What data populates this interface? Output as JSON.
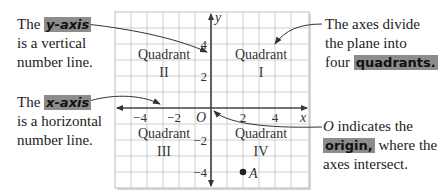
{
  "callouts": {
    "y_axis": {
      "prefix": "The ",
      "term": "y-axis",
      "line2": "is a vertical",
      "line3": "number line."
    },
    "x_axis": {
      "prefix": "The ",
      "term": "x-axis",
      "line2": "is a horizontal",
      "line3": "number line."
    },
    "quadrants": {
      "line1": "The axes divide",
      "line2": "the plane into",
      "prefix3": "four ",
      "term": "quadrants."
    },
    "origin": {
      "symbol": "O",
      "line1_rest": " indicates the",
      "term": "origin,",
      "line2_rest": " where the",
      "line3": "axes intersect."
    }
  },
  "graph": {
    "x_label": "x",
    "y_label": "y",
    "origin_label": "O",
    "x_ticks": [
      "−4",
      "−2",
      "2",
      "4"
    ],
    "y_ticks": [
      "4",
      "2",
      "−2",
      "−4"
    ],
    "quadrants": [
      {
        "word": "Quadrant",
        "numeral": "I"
      },
      {
        "word": "Quadrant",
        "numeral": "II"
      },
      {
        "word": "Quadrant",
        "numeral": "III"
      },
      {
        "word": "Quadrant",
        "numeral": "IV"
      }
    ],
    "point": {
      "label": "A",
      "x": 2,
      "y": -4
    }
  },
  "colors": {
    "highlight": "#8c8c8c",
    "grid": "#c8c8c8",
    "axis": "#444444"
  }
}
